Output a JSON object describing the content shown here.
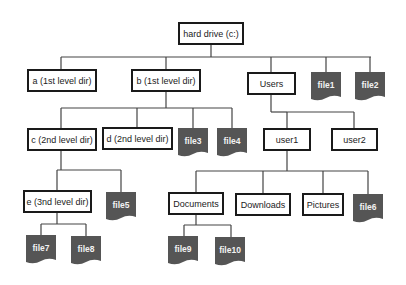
{
  "diagram": {
    "type": "file-system-tree",
    "colors": {
      "line": "#444444",
      "dir_border": "#1a1a1a",
      "file_fill": "#555555",
      "file_text": "#f2f2f2"
    },
    "root": {
      "id": "root",
      "label": "hard drive (c:)"
    },
    "directories": [
      {
        "id": "a",
        "label": "a (1st level dir)",
        "parent": "root"
      },
      {
        "id": "b",
        "label": "b (1st level dir)",
        "parent": "root"
      },
      {
        "id": "users",
        "label": "Users",
        "parent": "root"
      },
      {
        "id": "c",
        "label": "c (2nd level dir)",
        "parent": "b"
      },
      {
        "id": "d",
        "label": "d (2nd level dir)",
        "parent": "b"
      },
      {
        "id": "user1",
        "label": "user1",
        "parent": "users"
      },
      {
        "id": "user2",
        "label": "user2",
        "parent": "users"
      },
      {
        "id": "e",
        "label": "e (3nd level dir)",
        "parent": "c"
      },
      {
        "id": "documents",
        "label": "Documents",
        "parent": "user1"
      },
      {
        "id": "downloads",
        "label": "Downloads",
        "parent": "user1"
      },
      {
        "id": "pictures",
        "label": "Pictures",
        "parent": "user1"
      }
    ],
    "files": [
      {
        "id": "file1",
        "label": "file1",
        "parent": "root"
      },
      {
        "id": "file2",
        "label": "file2",
        "parent": "root"
      },
      {
        "id": "file3",
        "label": "file3",
        "parent": "b"
      },
      {
        "id": "file4",
        "label": "file4",
        "parent": "b"
      },
      {
        "id": "file5",
        "label": "file5",
        "parent": "c"
      },
      {
        "id": "file6",
        "label": "file6",
        "parent": "user1"
      },
      {
        "id": "file7",
        "label": "file7",
        "parent": "e"
      },
      {
        "id": "file8",
        "label": "file8",
        "parent": "e"
      },
      {
        "id": "file9",
        "label": "file9",
        "parent": "documents"
      },
      {
        "id": "file10",
        "label": "file10",
        "parent": "documents"
      }
    ]
  }
}
